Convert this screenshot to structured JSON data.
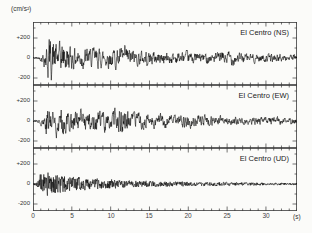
{
  "unit_label": "(cm/s²)",
  "xaxis": {
    "unit_label": "(s)",
    "tick_labels": [
      "0",
      "5",
      "10",
      "15",
      "20",
      "25",
      "30"
    ],
    "tick_values": [
      0,
      5,
      10,
      15,
      20,
      25,
      30
    ],
    "minor_step": 1,
    "max": 34
  },
  "chart_data": {
    "type": "line",
    "xlabel": "(s)",
    "ylabel": "(cm/s²)",
    "x_range": [
      0,
      34
    ],
    "y_range": [
      -360,
      270
    ],
    "y_ticks": [
      200,
      0,
      -200
    ],
    "y_minor_ticks": [
      300,
      100,
      -100
    ],
    "y_tick_labels": [
      "+200",
      "0",
      "-200"
    ],
    "grid": false,
    "legend_position": "none",
    "trace_color": "#000000",
    "axis_color": "#3a3a3a",
    "panels": [
      {
        "label": "El Centro (NS)",
        "peak_amplitude": 310,
        "seed": 42,
        "smooth": 0.55,
        "gain": 0.55,
        "envelope": [
          [
            0,
            12
          ],
          [
            0.7,
            20
          ],
          [
            1.1,
            45
          ],
          [
            1.6,
            150
          ],
          [
            2,
            310
          ],
          [
            2.6,
            260
          ],
          [
            3.2,
            200
          ],
          [
            4,
            210
          ],
          [
            4.8,
            160
          ],
          [
            6,
            150
          ],
          [
            7,
            130
          ],
          [
            8,
            140
          ],
          [
            9,
            120
          ],
          [
            10,
            140
          ],
          [
            11,
            130
          ],
          [
            12,
            150
          ],
          [
            13,
            110
          ],
          [
            14,
            95
          ],
          [
            15,
            100
          ],
          [
            16,
            85
          ],
          [
            17,
            90
          ],
          [
            18,
            80
          ],
          [
            19,
            85
          ],
          [
            20,
            75
          ],
          [
            21,
            80
          ],
          [
            22,
            70
          ],
          [
            23,
            65
          ],
          [
            24,
            75
          ],
          [
            25,
            110
          ],
          [
            25.8,
            95
          ],
          [
            26.5,
            70
          ],
          [
            27.5,
            60
          ],
          [
            28.5,
            65
          ],
          [
            29.5,
            55
          ],
          [
            30.5,
            55
          ],
          [
            32,
            50
          ],
          [
            34,
            45
          ]
        ]
      },
      {
        "label": "El Centro (EW)",
        "peak_amplitude": 260,
        "seed": 77,
        "smooth": 0.55,
        "gain": 0.55,
        "envelope": [
          [
            0,
            10
          ],
          [
            0.8,
            25
          ],
          [
            1.3,
            90
          ],
          [
            1.8,
            230
          ],
          [
            2.3,
            260
          ],
          [
            3,
            190
          ],
          [
            4,
            160
          ],
          [
            5,
            150
          ],
          [
            6,
            140
          ],
          [
            7,
            150
          ],
          [
            8,
            130
          ],
          [
            9,
            140
          ],
          [
            10,
            130
          ],
          [
            11,
            170
          ],
          [
            11.6,
            240
          ],
          [
            12.2,
            150
          ],
          [
            13,
            110
          ],
          [
            14,
            100
          ],
          [
            15,
            95
          ],
          [
            16,
            90
          ],
          [
            17,
            85
          ],
          [
            18,
            80
          ],
          [
            19,
            80
          ],
          [
            20,
            90
          ],
          [
            21,
            80
          ],
          [
            22,
            75
          ],
          [
            23,
            70
          ],
          [
            24,
            65
          ],
          [
            25,
            60
          ],
          [
            26,
            60
          ],
          [
            27,
            55
          ],
          [
            28,
            55
          ],
          [
            29,
            50
          ],
          [
            30,
            50
          ],
          [
            32,
            45
          ],
          [
            34,
            40
          ]
        ]
      },
      {
        "label": "El Centro (UD)",
        "peak_amplitude": 200,
        "seed": 99,
        "smooth": 0.12,
        "gain": 0.65,
        "envelope": [
          [
            0,
            8
          ],
          [
            0.4,
            25
          ],
          [
            0.8,
            120
          ],
          [
            1.2,
            200
          ],
          [
            1.7,
            170
          ],
          [
            2.2,
            180
          ],
          [
            2.8,
            150
          ],
          [
            3.5,
            130
          ],
          [
            4.5,
            120
          ],
          [
            5.5,
            100
          ],
          [
            6.5,
            95
          ],
          [
            7.5,
            85
          ],
          [
            8.5,
            80
          ],
          [
            10,
            70
          ],
          [
            11,
            60
          ],
          [
            12,
            55
          ],
          [
            13,
            50
          ],
          [
            14,
            48
          ],
          [
            15,
            45
          ],
          [
            16,
            42
          ],
          [
            17,
            40
          ],
          [
            18,
            38
          ],
          [
            19,
            35
          ],
          [
            20,
            33
          ],
          [
            21,
            32
          ],
          [
            22,
            30
          ],
          [
            23,
            28
          ],
          [
            24,
            28
          ],
          [
            25,
            26
          ],
          [
            26,
            25
          ],
          [
            27,
            24
          ],
          [
            28,
            22
          ],
          [
            29,
            22
          ],
          [
            30,
            20
          ],
          [
            31,
            20
          ],
          [
            32,
            18
          ],
          [
            34,
            16
          ]
        ]
      }
    ]
  }
}
